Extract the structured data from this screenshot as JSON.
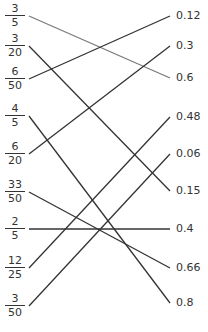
{
  "diagram": {
    "type": "matching-lines",
    "left_items": [
      {
        "num": "3",
        "den": "5",
        "y": 16
      },
      {
        "num": "3",
        "den": "20",
        "y": 46
      },
      {
        "num": "6",
        "den": "50",
        "y": 79
      },
      {
        "num": "4",
        "den": "5",
        "y": 116
      },
      {
        "num": "6",
        "den": "20",
        "y": 154
      },
      {
        "num": "33",
        "den": "50",
        "y": 192
      },
      {
        "num": "2",
        "den": "5",
        "y": 229
      },
      {
        "num": "12",
        "den": "25",
        "y": 268
      },
      {
        "num": "3",
        "den": "50",
        "y": 306
      }
    ],
    "right_items": [
      {
        "label": "0.12",
        "y": 16
      },
      {
        "label": "0.3",
        "y": 46
      },
      {
        "label": "0.6",
        "y": 78
      },
      {
        "label": "0.48",
        "y": 117
      },
      {
        "label": "0.06",
        "y": 154
      },
      {
        "label": "0.15",
        "y": 191
      },
      {
        "label": "0.4",
        "y": 229
      },
      {
        "label": "0.66",
        "y": 268
      },
      {
        "label": "0.8",
        "y": 303
      }
    ],
    "connections": [
      {
        "from": 0,
        "to": 2,
        "color": "#7a7a7a"
      },
      {
        "from": 1,
        "to": 5,
        "color": "#333333"
      },
      {
        "from": 2,
        "to": 0,
        "color": "#333333"
      },
      {
        "from": 3,
        "to": 8,
        "color": "#333333"
      },
      {
        "from": 4,
        "to": 1,
        "color": "#333333"
      },
      {
        "from": 5,
        "to": 7,
        "color": "#333333"
      },
      {
        "from": 6,
        "to": 6,
        "color": "#333333"
      },
      {
        "from": 7,
        "to": 3,
        "color": "#333333"
      },
      {
        "from": 8,
        "to": 4,
        "color": "#333333"
      }
    ],
    "line_left_x": 29,
    "line_right_x": 170
  }
}
